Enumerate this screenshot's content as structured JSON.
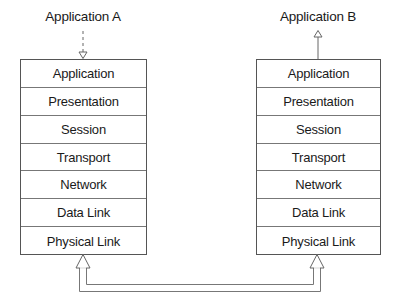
{
  "diagram": {
    "left_stack": {
      "application_label": "Application A",
      "layers": [
        "Application",
        "Presentation",
        "Session",
        "Transport",
        "Network",
        "Data Link",
        "Physical Link"
      ]
    },
    "right_stack": {
      "application_label": "Application B",
      "layers": [
        "Application",
        "Presentation",
        "Session",
        "Transport",
        "Network",
        "Data Link",
        "Physical Link"
      ]
    },
    "connections": [
      {
        "from": "Application A",
        "to": "left Application layer",
        "style": "dashed",
        "direction": "down"
      },
      {
        "from": "right Application layer",
        "to": "Application B",
        "style": "solid",
        "direction": "up"
      },
      {
        "from": "left Physical Link",
        "to": "right Physical Link",
        "style": "double-line",
        "direction": "bidirectional"
      }
    ],
    "colors": {
      "line": "#555555",
      "text": "#1a1a1a",
      "background": "#ffffff"
    }
  }
}
